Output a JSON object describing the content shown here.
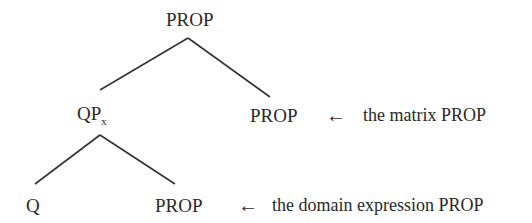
{
  "diagram": {
    "type": "syntax-tree",
    "nodes": {
      "root": {
        "label": "PROP"
      },
      "qp": {
        "label": "QP",
        "subscript": "x"
      },
      "matrix": {
        "label": "PROP"
      },
      "q": {
        "label": "Q"
      },
      "domain": {
        "label": "PROP"
      }
    },
    "annotations": {
      "matrix": {
        "arrow": "←",
        "text": "the matrix PROP"
      },
      "domain": {
        "arrow": "←",
        "text": "the domain expression PROP"
      }
    },
    "edges": [
      [
        "root",
        "qp"
      ],
      [
        "root",
        "matrix"
      ],
      [
        "qp",
        "q"
      ],
      [
        "qp",
        "domain"
      ]
    ],
    "line_color": "#333333"
  }
}
